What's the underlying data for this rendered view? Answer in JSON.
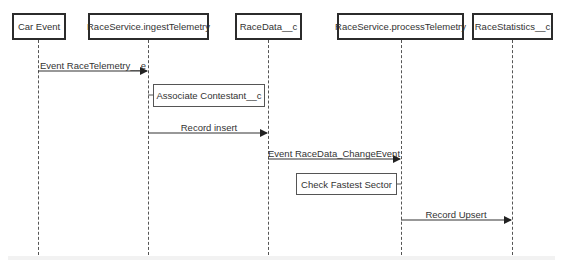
{
  "diagram": {
    "type": "sequence",
    "participants": [
      {
        "id": "car-event",
        "label": "Car Event"
      },
      {
        "id": "ingest",
        "label": "RaceService.ingestTelemetry"
      },
      {
        "id": "racedata",
        "label": "RaceData__c"
      },
      {
        "id": "process",
        "label": "RaceService.processTelemetry"
      },
      {
        "id": "racestats",
        "label": "RaceStatistics__c"
      }
    ],
    "messages": [
      {
        "from": "car-event",
        "to": "ingest",
        "label": "Event RaceTelemetry__e"
      },
      {
        "from": "ingest",
        "to": "racedata",
        "label": "Record insert"
      },
      {
        "from": "racedata",
        "to": "process",
        "label": "Event RaceData_ChangeEvent"
      },
      {
        "from": "process",
        "to": "racestats",
        "label": "Record Upsert"
      }
    ],
    "notes": [
      {
        "attached_to": "ingest",
        "label": "Associate Contestant__c"
      },
      {
        "attached_to": "process",
        "label": "Check Fastest Sector"
      }
    ]
  }
}
